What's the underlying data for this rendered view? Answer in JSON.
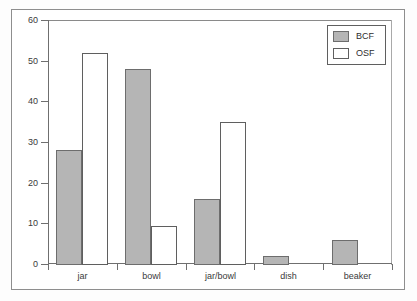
{
  "chart_data": {
    "type": "bar",
    "title": "",
    "subtitle": "",
    "xlabel": "",
    "ylabel": "",
    "categories": [
      "jar",
      "bowl",
      "jar/bowl",
      "dish",
      "beaker"
    ],
    "series": [
      {
        "name": "BCF",
        "values": [
          28,
          48,
          16,
          2,
          6
        ],
        "color": "#b5b5b5"
      },
      {
        "name": "OSF",
        "values": [
          52,
          9.3,
          35,
          0,
          0
        ],
        "color": "#ffffff"
      }
    ],
    "ylim": [
      0,
      60
    ],
    "ytick_labels": [
      "60",
      "50",
      "40",
      "30",
      "20",
      "10",
      "0"
    ],
    "ytick_values": [
      60,
      50,
      40,
      30,
      20,
      10,
      0
    ],
    "grid": false,
    "legend_position": "top-right",
    "legend_entries": [
      "BCF",
      "OSF"
    ]
  },
  "axis": {
    "y_labels": [
      "60",
      "50",
      "40",
      "30",
      "20",
      "10",
      "0"
    ],
    "x_labels": [
      "jar",
      "bowl",
      "jar/bowl",
      "dish",
      "beaker"
    ]
  },
  "legend": {
    "items": [
      {
        "label": "BCF",
        "swatch": "filled-gray-swatch"
      },
      {
        "label": "OSF",
        "swatch": "empty-white-swatch"
      }
    ]
  }
}
